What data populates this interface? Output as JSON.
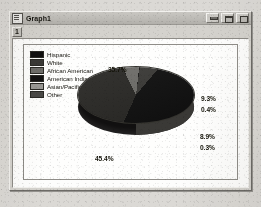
{
  "window": {
    "title": "Graph1",
    "icon": "document-icon",
    "buttons": [
      {
        "name": "minimize-button",
        "label": ""
      },
      {
        "name": "restore-button",
        "label": ""
      },
      {
        "name": "close-button",
        "label": ""
      }
    ]
  },
  "toolbar": {
    "page_chip_label": "1"
  },
  "chart_data": {
    "type": "pie",
    "title": "",
    "xlabel": "",
    "ylabel": "",
    "legend_position": "top-left",
    "grid": false,
    "three_d": true,
    "categories": [
      "Hispanic",
      "White",
      "African American",
      "American Indian",
      "Asian/Pacific",
      "Other"
    ],
    "values": [
      35.7,
      45.4,
      8.9,
      0.3,
      9.3,
      0.4
    ],
    "value_labels": [
      "35.7%",
      "45.4%",
      "8.9%",
      "0.3%",
      "9.3%",
      "0.4%"
    ],
    "colors": [
      "#111010",
      "#3a3936",
      "#6f6e6a",
      "#131212",
      "#9b9a96",
      "#4a4946"
    ],
    "legend": [
      {
        "label": "Hispanic",
        "color": "#111010"
      },
      {
        "label": "White",
        "color": "#3a3936"
      },
      {
        "label": "African American",
        "color": "#6f6e6a"
      },
      {
        "label": "American Indian",
        "color": "#131212"
      },
      {
        "label": "Asian/Pacific",
        "color": "#9b9a96"
      },
      {
        "label": "Other",
        "color": "#4a4946"
      }
    ]
  }
}
